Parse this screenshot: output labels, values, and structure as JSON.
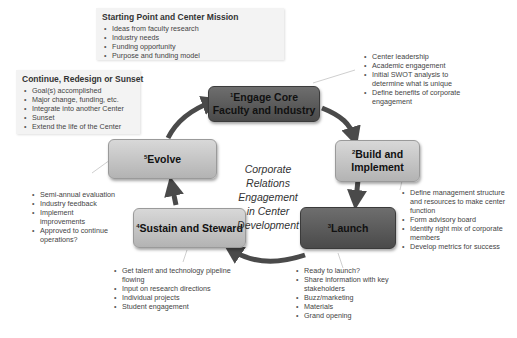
{
  "colors": {
    "dark_stage": "#555555",
    "light_stage": "#c4c4c4",
    "arrow": "#4a4a4a",
    "panel_bg": "#f3f3f3"
  },
  "center_label": {
    "lines": [
      "Corporate",
      "Relations",
      "Engagement",
      "in Center",
      "Development"
    ]
  },
  "starting_panel": {
    "title": "Starting Point and Center Mission",
    "items": [
      "Ideas from faculty research",
      "Industry needs",
      "Funding opportunity",
      "Purpose and funding model"
    ]
  },
  "continue_panel": {
    "title": "Continue, Redesign or Sunset",
    "items": [
      "Goal(s) accomplished",
      "Major change, funding, etc.",
      "Integrate into another Center",
      "Sunset",
      "Extend the life of the Center"
    ]
  },
  "stages": [
    {
      "number": "1",
      "label_line1": "Engage Core",
      "label_line2": "Faculty and Industry",
      "style": "dark"
    },
    {
      "number": "2",
      "label_line1": "Build and",
      "label_line2": "Implement",
      "style": "light"
    },
    {
      "number": "3",
      "label_line1": "Launch",
      "label_line2": "",
      "style": "dark"
    },
    {
      "number": "4",
      "label_line1": "Sustain and Steward",
      "label_line2": "",
      "style": "light"
    },
    {
      "number": "5",
      "label_line1": "Evolve",
      "label_line2": "",
      "style": "light"
    }
  ],
  "notes": {
    "engage": [
      "Center leadership",
      "Academic engagement",
      "Initial SWOT analysis to determine what is unique",
      "Define benefits of corporate engagement"
    ],
    "build": [
      "Define management structure and resources to make center function",
      "Form advisory board",
      "Identify right mix of corporate members",
      "Develop metrics for success"
    ],
    "launch": [
      "Ready to launch?",
      "Share information with key stakeholders",
      "Buzz/marketing",
      "Materials",
      "Grand opening"
    ],
    "sustain": [
      "Get talent and technology pipeline flowing",
      "Input on research directions",
      "Individual projects",
      "Student engagement"
    ],
    "evolve": [
      "Semi-annual evaluation",
      "Industry feedback",
      "Implement improvements",
      "Approved to continue operations?"
    ]
  }
}
